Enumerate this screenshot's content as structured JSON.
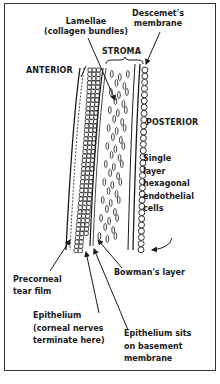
{
  "diagram": {
    "colors": {
      "ink": "#1a1a1a",
      "background": "#ffffff",
      "frame": "#333333"
    },
    "labels": {
      "lamellae": [
        "Lamellae",
        "(collagen bundles)"
      ],
      "descemet": [
        "Descemet's",
        "membrane"
      ],
      "stroma": "STROMA",
      "anterior": "ANTERIOR",
      "posterior": "POSTERIOR",
      "endothelium": [
        "Single",
        "layer",
        "hexagonal",
        "endothelial",
        "cells"
      ],
      "tear_film": [
        "Precorneal",
        "tear film"
      ],
      "bowman": "Bowman's layer",
      "epithelium": [
        "Epithelium",
        "(corneal nerves",
        "terminate here)"
      ],
      "basement": [
        "Epithelium sits",
        "on basement",
        "membrane"
      ]
    }
  }
}
